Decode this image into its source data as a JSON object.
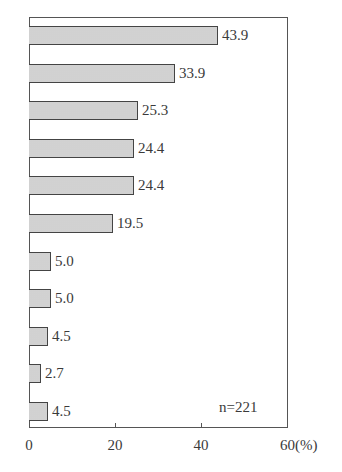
{
  "chart_data": {
    "type": "bar",
    "orientation": "horizontal",
    "title": "",
    "xlabel": "(%)",
    "ylabel": "",
    "categories": [
      "",
      "",
      "",
      "",
      "",
      "",
      "",
      "",
      "",
      "",
      ""
    ],
    "values": [
      43.9,
      33.9,
      25.3,
      24.4,
      24.4,
      19.5,
      5.0,
      5.0,
      4.5,
      2.7,
      4.5
    ],
    "value_labels": [
      "43.9",
      "33.9",
      "25.3",
      "24.4",
      "24.4",
      "19.5",
      "5.0",
      "5.0",
      "4.5",
      "2.7",
      "4.5"
    ],
    "xlim": [
      0,
      60
    ],
    "x_ticks": [
      0,
      20,
      40,
      60
    ],
    "x_tick_labels": [
      "0",
      "20",
      "40",
      "60(%)"
    ],
    "annotation": "n=221",
    "grid": false,
    "legend": null
  },
  "style": {
    "bar_fill": "#e6e6e6",
    "bar_stroke": "#444444",
    "frame_color": "#555555",
    "text_color": "#3a3a3a"
  }
}
